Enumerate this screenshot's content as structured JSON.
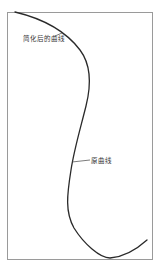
{
  "diagram": {
    "labels": {
      "simplified_curve": "简化后的曲线",
      "original_curve": "原曲线"
    },
    "colors": {
      "curve": "#2a2a2a",
      "frame": "#9a9a9a",
      "leader": "#444444",
      "text": "#333333"
    }
  }
}
